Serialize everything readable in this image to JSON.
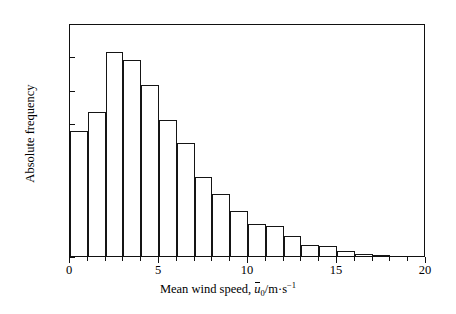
{
  "chart": {
    "type": "bar",
    "title": "",
    "ylabel": "Absolute frequency",
    "xlabel_prefix": "Mean wind speed, ",
    "xlabel_symbol": "u",
    "xlabel_subscript": "0",
    "xlabel_units": "/m·s",
    "xlabel_exponent": "−1",
    "xlabel_full": "Mean wind speed, u̅0/m·s−1"
  },
  "axes": {
    "x_ticks": [
      0,
      5,
      10,
      15,
      20
    ],
    "x_tick_labels": [
      "0",
      "5",
      "10",
      "15",
      "20"
    ],
    "y_ticks": [
      0,
      200,
      400,
      600,
      800,
      1000,
      1200,
      1400
    ],
    "y_tick_labels": [
      "0",
      "200",
      "400",
      "600",
      "800",
      "1000",
      "1200",
      "1400"
    ],
    "xlim": [
      0,
      20
    ],
    "ylim": [
      0,
      1400
    ],
    "grid": false,
    "legend": "none"
  },
  "chart_data": {
    "type": "bar",
    "title": "",
    "xlabel": "Mean wind speed, u̅0/m·s−1",
    "ylabel": "Absolute frequency",
    "xlim": [
      0,
      20
    ],
    "ylim": [
      0,
      1400
    ],
    "grid": false,
    "legend_position": "none",
    "bin_width": 1,
    "bin_edges": [
      0,
      1,
      2,
      3,
      4,
      5,
      6,
      7,
      8,
      9,
      10,
      11,
      12,
      13,
      14,
      15,
      16,
      17,
      18,
      19,
      20
    ],
    "categories": [
      "0-1",
      "1-2",
      "2-3",
      "3-4",
      "4-5",
      "5-6",
      "6-7",
      "7-8",
      "8-9",
      "9-10",
      "10-11",
      "11-12",
      "12-13",
      "13-14",
      "14-15",
      "15-16",
      "16-17",
      "17-18",
      "18-19",
      "19-20"
    ],
    "values": [
      750,
      865,
      1225,
      1180,
      1030,
      815,
      680,
      475,
      370,
      270,
      195,
      180,
      120,
      65,
      60,
      30,
      15,
      5,
      0,
      0
    ]
  },
  "colors": {
    "bar_fill": "#ffffff",
    "bar_edge": "#151515",
    "axis": "#111111",
    "text": "#000000",
    "background": "#ffffff"
  }
}
